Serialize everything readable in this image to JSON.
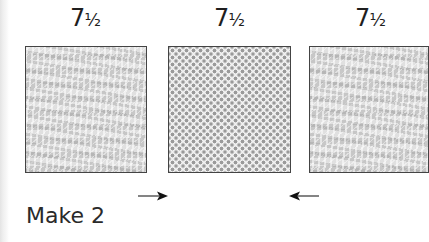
{
  "diagram": {
    "dimensions": [
      {
        "whole": "7",
        "fraction": "½"
      },
      {
        "whole": "7",
        "fraction": "½"
      },
      {
        "whole": "7",
        "fraction": "½"
      }
    ],
    "blocks": [
      {
        "fabric": "lace-print"
      },
      {
        "fabric": "polka-dot"
      },
      {
        "fabric": "lace-print"
      }
    ],
    "arrows": [
      {
        "direction": "right"
      },
      {
        "direction": "left"
      }
    ],
    "instruction": "Make 2"
  }
}
